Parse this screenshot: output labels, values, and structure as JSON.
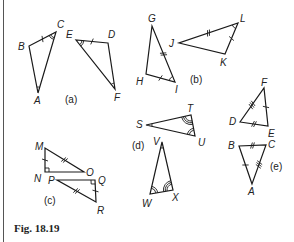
{
  "figure": {
    "caption": "Fig. 18.19",
    "parts": [
      {
        "label": "(a)",
        "triangles": [
          {
            "name": "ABC",
            "vertices": [
              "A",
              "B",
              "C"
            ],
            "labels": {
              "A": "A",
              "B": "B",
              "C": "C"
            },
            "marks": {
              "sides": [
                {
                  "side": "BC",
                  "ticks": 1
                }
              ],
              "angles": [
                {
                  "at": "C",
                  "arcs": 2
                },
                {
                  "at": "A",
                  "arcs": 1
                }
              ]
            }
          },
          {
            "name": "DEF",
            "vertices": [
              "D",
              "E",
              "F"
            ],
            "labels": {
              "D": "D",
              "E": "E",
              "F": "F"
            },
            "marks": {
              "sides": [
                {
                  "side": "ED",
                  "ticks": 1
                }
              ],
              "angles": [
                {
                  "at": "E",
                  "arcs": 2
                },
                {
                  "at": "F",
                  "arcs": 1
                }
              ]
            }
          }
        ]
      },
      {
        "label": "(b)",
        "triangles": [
          {
            "name": "GHI",
            "vertices": [
              "G",
              "H",
              "I"
            ],
            "labels": {
              "G": "G",
              "H": "H",
              "I": "I"
            },
            "marks": {
              "sides": [
                {
                  "side": "GI",
                  "ticks": 2
                },
                {
                  "side": "HI",
                  "ticks": 1
                }
              ],
              "angles": [
                {
                  "at": "I",
                  "arcs": 1
                }
              ]
            }
          },
          {
            "name": "JKL",
            "vertices": [
              "J",
              "K",
              "L"
            ],
            "labels": {
              "J": "J",
              "K": "K",
              "L": "L"
            },
            "marks": {
              "sides": [
                {
                  "side": "JL",
                  "ticks": 2
                },
                {
                  "side": "KL",
                  "ticks": 1
                }
              ],
              "angles": [
                {
                  "at": "L",
                  "arcs": 1
                }
              ]
            }
          }
        ]
      },
      {
        "label": "(c)",
        "triangles": [
          {
            "name": "MNO",
            "vertices": [
              "M",
              "N",
              "O"
            ],
            "labels": {
              "M": "M",
              "N": "N",
              "O": "O"
            },
            "marks": {
              "sides": [
                {
                  "side": "MN",
                  "ticks": 1
                },
                {
                  "side": "MO",
                  "ticks": 2
                }
              ],
              "angles": [
                {
                  "at": "N",
                  "right": true
                }
              ]
            }
          },
          {
            "name": "PQR",
            "vertices": [
              "P",
              "Q",
              "R"
            ],
            "labels": {
              "P": "P",
              "Q": "Q",
              "R": "R"
            },
            "marks": {
              "sides": [
                {
                  "side": "QR",
                  "ticks": 1
                },
                {
                  "side": "PR",
                  "ticks": 2
                }
              ],
              "angles": [
                {
                  "at": "Q",
                  "right": true
                }
              ]
            }
          }
        ]
      },
      {
        "label": "(d)",
        "triangles": [
          {
            "name": "STU",
            "vertices": [
              "S",
              "T",
              "U"
            ],
            "labels": {
              "S": "S",
              "T": "T",
              "U": "U"
            },
            "marks": {
              "sides": [],
              "angles": [
                {
                  "at": "S",
                  "arcs": 1
                },
                {
                  "at": "T",
                  "arcs": 3
                },
                {
                  "at": "U",
                  "arcs": 2
                }
              ]
            }
          },
          {
            "name": "VWX",
            "vertices": [
              "V",
              "W",
              "X"
            ],
            "labels": {
              "V": "V",
              "W": "W",
              "X": "X"
            },
            "marks": {
              "sides": [],
              "angles": [
                {
                  "at": "V",
                  "arcs": 1
                },
                {
                  "at": "W",
                  "arcs": 2
                },
                {
                  "at": "X",
                  "arcs": 3
                }
              ]
            }
          }
        ]
      },
      {
        "label": "(e)",
        "triangles": [
          {
            "name": "DEF",
            "vertices": [
              "D",
              "E",
              "F"
            ],
            "labels": {
              "D": "D",
              "E": "E",
              "F": "F"
            },
            "marks": {
              "sides": [
                {
                  "side": "DF",
                  "ticks": 3
                },
                {
                  "side": "EF",
                  "ticks": 1
                },
                {
                  "side": "DE",
                  "ticks": 2
                }
              ],
              "angles": []
            }
          },
          {
            "name": "ABC",
            "vertices": [
              "A",
              "B",
              "C"
            ],
            "labels": {
              "A": "A",
              "B": "B",
              "C": "C"
            },
            "marks": {
              "sides": [
                {
                  "side": "AB",
                  "ticks": 1
                },
                {
                  "side": "BC",
                  "ticks": 2
                },
                {
                  "side": "AC",
                  "ticks": 3
                }
              ],
              "angles": []
            }
          }
        ]
      }
    ]
  }
}
